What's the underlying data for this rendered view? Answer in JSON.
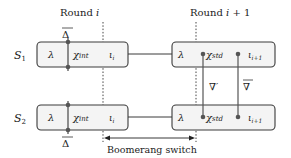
{
  "title_left": "Round i",
  "title_right": "Round i+1",
  "rows": [
    {
      "label": "S",
      "sub": "1"
    },
    {
      "label": "S",
      "sub": "2"
    }
  ],
  "left_block": {
    "cells": [
      "λ",
      "χint",
      "ιi"
    ],
    "chi_main": "χ",
    "chi_sub": "int",
    "iota_main": "ι",
    "iota_sub": "i"
  },
  "right_block": {
    "cells": [
      "λ",
      "χstd",
      "ιi+1"
    ],
    "chi_main": "χ",
    "chi_sub": "std",
    "iota_main": "ι",
    "iota_sub": "i+1"
  },
  "annotations": {
    "delta_top": "Δ",
    "delta_bottom": "Δ",
    "nabla_prime": "∇'",
    "nabla_bar": "∇"
  },
  "switch_label": "Boomerang switch",
  "colors": {
    "box_fill": "#f4f4f4",
    "stroke": "#3a3a3a",
    "dot": "#555555"
  }
}
